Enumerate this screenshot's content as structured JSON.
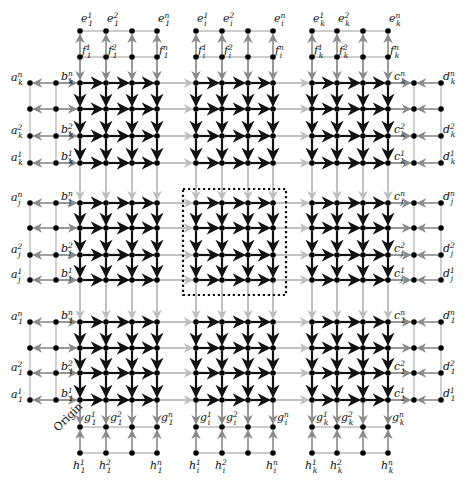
{
  "diagram": {
    "title": "",
    "colors": {
      "dark": "#111111",
      "gray_arrow": "#8a8a8a",
      "light_line": "#bdbdbd",
      "node": "#000000",
      "background": "#ffffff"
    },
    "grid": {
      "block_columns": [
        [
          80,
          106,
          132,
          157
        ],
        [
          196,
          222,
          248,
          273
        ],
        [
          312,
          337,
          363,
          388
        ]
      ],
      "block_rows": [
        [
          83,
          109,
          136,
          163
        ],
        [
          203,
          228,
          255,
          280
        ],
        [
          322,
          348,
          373,
          400
        ]
      ],
      "column_block_labels": [
        "1",
        "i",
        "k"
      ],
      "row_block_labels": [
        "k",
        "j",
        "1"
      ],
      "layer_index_labels": [
        "1",
        "2",
        "",
        "n"
      ],
      "a_x": 30,
      "b_x": 56,
      "c_x": 414,
      "d_x": 441,
      "e_y": 31,
      "f_y": 57,
      "g_y": 427,
      "h_y": 453
    },
    "highlight_box": {
      "x": 183,
      "y": 189,
      "width": 103,
      "height": 106,
      "style": "dotted"
    },
    "origin_label": "Origin",
    "vertex_labels": {
      "a": [
        "a_k^n",
        "a_k^2",
        "a_k^1",
        "a_j^n",
        "a_j^2",
        "a_j^1",
        "a_1^n",
        "a_1^2",
        "a_1^1"
      ],
      "b": [
        "b_k^n",
        "b_k^2",
        "b_k^1",
        "b_j^n",
        "b_j^2",
        "b_j^1",
        "b_1^n",
        "b_1^2",
        "b_1^1"
      ],
      "c": [
        "c_k^n",
        "c_k^2",
        "c_k^1",
        "c_j^n",
        "c_j^2",
        "c_j^1",
        "c_1^n",
        "c_1^2",
        "c_1^1"
      ],
      "d": [
        "d_k^n",
        "d_k^2",
        "d_k^1",
        "d_j^n",
        "d_j^2",
        "d_j^1",
        "d_1^n",
        "d_1^2",
        "d_1^1"
      ],
      "e": [
        "e_1^1",
        "e_1^2",
        "e_1^n",
        "e_i^1",
        "e_i^2",
        "e_i^n",
        "e_k^1",
        "e_k^2",
        "e_k^n"
      ],
      "f": [
        "f_1^1",
        "f_1^2",
        "f_1^n",
        "f_i^1",
        "f_i^2",
        "f_i^n",
        "f_k^1",
        "f_k^2",
        "f_k^n"
      ],
      "g": [
        "g_1^1",
        "g_1^2",
        "g_1^n",
        "g_i^1",
        "g_i^2",
        "g_i^n",
        "g_k^1",
        "g_k^2",
        "g_k^n"
      ],
      "h": [
        "h_1^1",
        "h_1^2",
        "h_1^n",
        "h_i^1",
        "h_i^2",
        "h_i^n",
        "h_k^1",
        "h_k^2",
        "h_k^n"
      ]
    },
    "edge_semantics": {
      "inner_horizontal": "dark arrows pointing right within each block",
      "inner_vertical": "dark arrows pointing down within each block",
      "between_blocks": "light gray arrows pointing right/down",
      "a_to_b": "gray arrows pointing left (b to a)",
      "b_to_grid": "gray arrows pointing right",
      "grid_to_c": "gray arrows pointing right",
      "d_to_c": "gray arrows pointing left",
      "f_to_e": "gray arrows pointing up",
      "f_to_grid": "gray arrows pointing down",
      "grid_to_g": "gray arrows pointing down",
      "h_to_g": "gray arrows pointing up"
    }
  }
}
